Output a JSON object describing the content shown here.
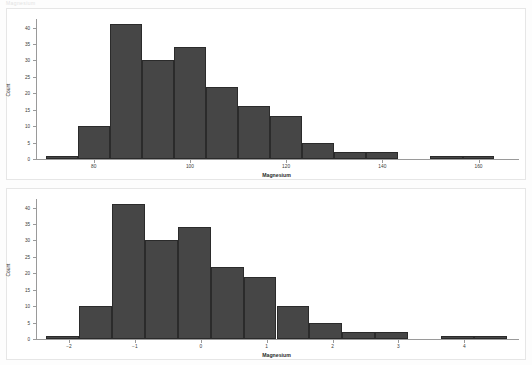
{
  "document": {
    "faint_header": "Magnesium"
  },
  "colors": {
    "bar_fill": "#464646",
    "bar_stroke": "#2b2b2b",
    "axis": "#9a9a9a",
    "panel_border": "#e6e6e6",
    "page_background": "#fdfdfd"
  },
  "panels": [
    {
      "name": "raw-magnesium-histogram"
    },
    {
      "name": "standardized-magnesium-histogram"
    }
  ],
  "chart_data": [
    {
      "type": "bar",
      "name": "magnesium-raw-histogram",
      "title": "",
      "xlabel": "Magnesium",
      "ylabel": "Count",
      "xlim": [
        68,
        168
      ],
      "ylim": [
        0,
        42
      ],
      "grid": false,
      "legend": "none",
      "xticks": [
        80,
        100,
        120,
        140,
        160
      ],
      "xticklabels": [
        "80",
        "100",
        "120",
        "140",
        "160"
      ],
      "yticks": [
        0,
        5,
        10,
        15,
        20,
        25,
        30,
        35,
        40
      ],
      "yticklabels": [
        "0",
        "5",
        "10",
        "15",
        "20",
        "25",
        "30",
        "35",
        "40"
      ],
      "bin_edges": [
        70,
        76.7,
        83.3,
        90,
        96.7,
        103.3,
        110,
        116.7,
        123.3,
        130,
        136.7,
        143.3,
        150,
        156.7,
        163.3
      ],
      "categories": [
        "70-76.7",
        "76.7-83.3",
        "83.3-90",
        "90-96.7",
        "96.7-103.3",
        "103.3-110",
        "110-116.7",
        "116.7-123.3",
        "123.3-130",
        "130-136.7",
        "136.7-143.3",
        "143.3-150",
        "150-156.7",
        "156.7-163.3"
      ],
      "values": [
        1,
        10,
        41,
        30,
        34,
        22,
        16,
        13,
        5,
        2,
        2,
        0,
        1,
        1
      ]
    },
    {
      "type": "bar",
      "name": "magnesium-standardized-histogram",
      "title": "",
      "xlabel": "Magnesium",
      "ylabel": "Count",
      "xlim": [
        -2.5,
        4.8
      ],
      "ylim": [
        0,
        42
      ],
      "grid": false,
      "legend": "none",
      "xticks": [
        -2,
        -1,
        0,
        1,
        2,
        3,
        4
      ],
      "xticklabels": [
        "−2",
        "−1",
        "0",
        "1",
        "2",
        "3",
        "4"
      ],
      "yticks": [
        0,
        5,
        10,
        15,
        20,
        25,
        30,
        35,
        40
      ],
      "yticklabels": [
        "0",
        "5",
        "10",
        "15",
        "20",
        "25",
        "30",
        "35",
        "40"
      ],
      "bin_edges": [
        -2.35,
        -1.85,
        -1.35,
        -0.85,
        -0.35,
        0.15,
        0.65,
        1.15,
        1.65,
        2.15,
        2.65,
        3.15,
        3.65,
        4.15,
        4.65
      ],
      "categories": [
        "-2.35--1.85",
        "-1.85--1.35",
        "-1.35--0.85",
        "-0.85--0.35",
        "-0.35-0.15",
        "0.15-0.65",
        "0.65-1.15",
        "1.15-1.65",
        "1.65-2.15",
        "2.15-2.65",
        "2.65-3.15",
        "3.15-3.65",
        "3.65-4.15",
        "4.15-4.65"
      ],
      "values": [
        1,
        10,
        41,
        30,
        34,
        22,
        19,
        10,
        5,
        2,
        2,
        0,
        1,
        1
      ]
    }
  ]
}
